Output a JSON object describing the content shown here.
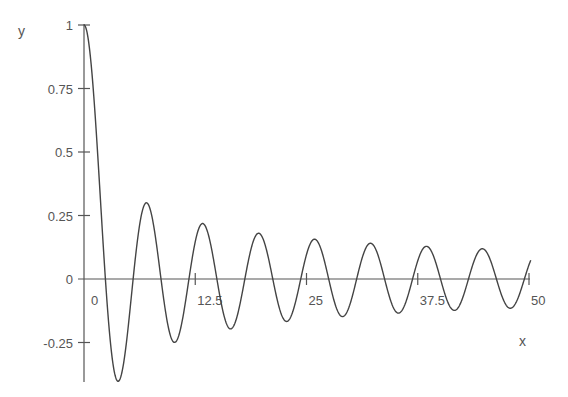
{
  "chart_data": {
    "type": "line",
    "title": "",
    "xlabel": "x",
    "ylabel": "y",
    "xlim": [
      0,
      50
    ],
    "ylim": [
      -0.4,
      1
    ],
    "grid": false,
    "legend": null,
    "x_ticks": [
      {
        "value": 0,
        "label": "0"
      },
      {
        "value": 12.5,
        "label": "12.5"
      },
      {
        "value": 25,
        "label": "25"
      },
      {
        "value": 37.5,
        "label": "37.5"
      },
      {
        "value": 50,
        "label": "50"
      }
    ],
    "y_ticks": [
      {
        "value": 1,
        "label": "1"
      },
      {
        "value": 0.75,
        "label": "0.75"
      },
      {
        "value": 0.5,
        "label": "0.5"
      },
      {
        "value": 0.25,
        "label": "0.25"
      },
      {
        "value": 0,
        "label": "0"
      },
      {
        "value": -0.25,
        "label": "-0.25"
      }
    ],
    "series": [
      {
        "name": "J0(x)",
        "description": "Damped oscillation resembling Bessel function J0(x)",
        "x": [
          0,
          2.4,
          3.83,
          5.52,
          7.02,
          8.65,
          10.17,
          11.79,
          13.32,
          14.93,
          16.47,
          18.07,
          19.62,
          21.21,
          22.76,
          24.35,
          25.9,
          27.49,
          29.05,
          30.63,
          32.19,
          33.78,
          35.33,
          36.92,
          38.47,
          40.06,
          41.62,
          43.2,
          44.76,
          46.34,
          47.9,
          49.48,
          50.2
        ],
        "y": [
          1,
          0,
          -0.403,
          0,
          0.3,
          0,
          -0.25,
          0,
          0.218,
          0,
          -0.196,
          0,
          0.18,
          0,
          -0.167,
          0,
          0.157,
          0,
          -0.148,
          0,
          0.141,
          0,
          -0.134,
          0,
          0.129,
          0,
          -0.124,
          0,
          0.119,
          0,
          -0.115,
          0,
          0.05
        ]
      }
    ]
  }
}
